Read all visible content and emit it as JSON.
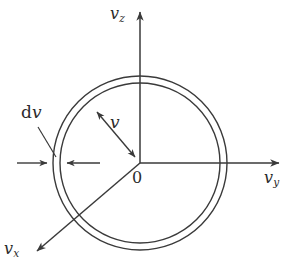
{
  "figure": {
    "kind": "velocity-space-spherical-shell-diagram",
    "title_caption": "",
    "background_color": "#ffffff",
    "stroke_color": "#3a3a3a",
    "text_color": "#2b2b2b",
    "axes": [
      {
        "id": "vz",
        "label_main": "v",
        "label_sub": "z",
        "direction": "up",
        "from": [
          140,
          163
        ],
        "to": [
          140,
          6
        ]
      },
      {
        "id": "vy",
        "label_main": "v",
        "label_sub": "y",
        "direction": "right",
        "from": [
          140,
          163
        ],
        "to": [
          285,
          163
        ]
      },
      {
        "id": "vx",
        "label_main": "v",
        "label_sub": "x",
        "direction": "down-left",
        "from": [
          140,
          163
        ],
        "to": [
          31,
          256
        ]
      }
    ],
    "origin": {
      "label": "0",
      "x": 140,
      "y": 163
    },
    "shell": {
      "center": [
        140,
        163
      ],
      "outer_radius": 87,
      "inner_radius": 80,
      "description": "thin spherical shell of radius v and thickness dv"
    },
    "radius_arrow": {
      "label_main": "v",
      "label_sub": "",
      "from": [
        140,
        163
      ],
      "to": [
        92,
        107
      ],
      "double_headed": true
    },
    "thickness_callout": {
      "label_upright": "d",
      "label_italic": "v",
      "leader_from": [
        38,
        127
      ],
      "leader_to": [
        57,
        158
      ],
      "left_arrow_from": [
        17,
        163
      ],
      "left_arrow_to": [
        51,
        163
      ],
      "right_arrow_from": [
        100,
        163
      ],
      "right_arrow_to": [
        63,
        163
      ]
    }
  }
}
